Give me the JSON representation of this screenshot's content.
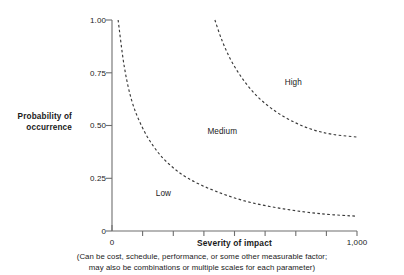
{
  "chart_data": {
    "type": "line",
    "title": "",
    "xlabel": "Severity of impact",
    "ylabel_line1": "Probability of",
    "ylabel_line2": "occurrence",
    "caption_line1": "(Can be cost, schedule, performance, or some other measurable factor;",
    "caption_line2": "may also be combinations or multiple scales for each parameter)",
    "xlim": [
      0,
      1000
    ],
    "ylim": [
      0,
      1.0
    ],
    "grid": false,
    "legend": "none",
    "x_tick_labels": [
      "0",
      "1,000"
    ],
    "x_tick_values": [
      0,
      1000
    ],
    "x_minor_tick_count": 7,
    "y_tick_labels": [
      "0",
      "0.25",
      "0.50",
      "0.75",
      "1.00"
    ],
    "y_tick_values": [
      0,
      0.25,
      0.5,
      0.75,
      1.0
    ],
    "line_style": "dashed",
    "line_color": "#3a3a3a",
    "axis_color": "#6e6e6e",
    "series": [
      {
        "name": "low-medium-boundary",
        "points": [
          {
            "x": 25,
            "y": 1.0
          },
          {
            "x": 50,
            "y": 0.78
          },
          {
            "x": 80,
            "y": 0.62
          },
          {
            "x": 120,
            "y": 0.5
          },
          {
            "x": 170,
            "y": 0.4
          },
          {
            "x": 230,
            "y": 0.32
          },
          {
            "x": 310,
            "y": 0.25
          },
          {
            "x": 420,
            "y": 0.19
          },
          {
            "x": 550,
            "y": 0.14
          },
          {
            "x": 700,
            "y": 0.105
          },
          {
            "x": 850,
            "y": 0.082
          },
          {
            "x": 1000,
            "y": 0.07
          }
        ]
      },
      {
        "name": "medium-high-boundary",
        "points": [
          {
            "x": 420,
            "y": 1.0
          },
          {
            "x": 450,
            "y": 0.9
          },
          {
            "x": 490,
            "y": 0.8
          },
          {
            "x": 540,
            "y": 0.71
          },
          {
            "x": 600,
            "y": 0.63
          },
          {
            "x": 670,
            "y": 0.565
          },
          {
            "x": 745,
            "y": 0.515
          },
          {
            "x": 820,
            "y": 0.48
          },
          {
            "x": 900,
            "y": 0.458
          },
          {
            "x": 1000,
            "y": 0.445
          }
        ]
      }
    ],
    "annotations": [
      {
        "text": "Low",
        "x": 210,
        "y": 0.18
      },
      {
        "text": "Medium",
        "x": 450,
        "y": 0.47
      },
      {
        "text": "High",
        "x": 740,
        "y": 0.705
      }
    ]
  }
}
